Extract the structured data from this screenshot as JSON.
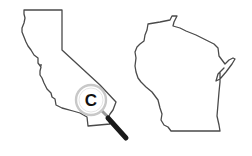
{
  "scene": {
    "description": "Two US state outlines: California (left) with a magnifying glass, Wisconsin (right)",
    "background": "#ffffff"
  },
  "states": [
    {
      "name": "California",
      "position": "left"
    },
    {
      "name": "Wisconsin",
      "position": "right"
    }
  ],
  "magnifier": {
    "letter": "C",
    "over_state": "California",
    "colors": {
      "ring": "#c8c8c8",
      "handle": "#1a1a1a",
      "letter": "#111111"
    }
  },
  "colors": {
    "outline": "#4a4a4a"
  }
}
